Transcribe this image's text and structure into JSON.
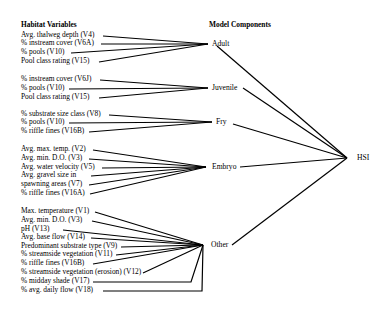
{
  "headers": {
    "left": "Habitat Variables",
    "middle": "Model Components"
  },
  "output": {
    "label": "HSI",
    "x": 347,
    "y": 158
  },
  "groups": [
    {
      "component": "Adult",
      "hub": [
        208,
        44
      ],
      "label_x": 212,
      "variables": [
        {
          "label": "Avg. thalweg depth (V4)",
          "y": 35,
          "end_x": 100
        },
        {
          "label": "% instream cover (V6A)",
          "y": 43,
          "end_x": 98
        },
        {
          "label": "% pools (V10)",
          "y": 52,
          "end_x": 68
        },
        {
          "label": "Pool class rating (V15)",
          "y": 61,
          "end_x": 96
        }
      ]
    },
    {
      "component": "Juvenile",
      "hub": [
        208,
        88
      ],
      "label_x": 212,
      "variables": [
        {
          "label": "% instream cover (V6J)",
          "y": 79,
          "end_x": 97
        },
        {
          "label": "% pools (V10)",
          "y": 88,
          "end_x": 66
        },
        {
          "label": "Pool class rating (V15)",
          "y": 97,
          "end_x": 96
        }
      ]
    },
    {
      "component": "Fry",
      "hub": [
        212,
        122
      ],
      "label_x": 216,
      "variables": [
        {
          "label": "% substrate size class (V8)",
          "y": 114,
          "end_x": 106
        },
        {
          "label": "% pools (V10)",
          "y": 122,
          "end_x": 66
        },
        {
          "label": "% riffle fines (V16B)",
          "y": 131,
          "end_x": 86
        }
      ]
    },
    {
      "component": "Embryo",
      "hub": [
        206,
        167
      ],
      "label_x": 212,
      "variables": [
        {
          "label": "Avg. max. temp. (V2)",
          "y": 149,
          "end_x": 90
        },
        {
          "label": "Avg. min. D.O. (V3)",
          "y": 158,
          "end_x": 86
        },
        {
          "label": "Avg. water velocity (V5)",
          "y": 167,
          "end_x": 99
        },
        {
          "label": "Avg. gravel size in",
          "y": 175,
          "end_x": 88
        },
        {
          "label": "spawning areas (V7)",
          "y": 184,
          "end_x": 86
        },
        {
          "label": "% riffle fines (V16A)",
          "y": 193,
          "end_x": 87
        }
      ]
    },
    {
      "component": "Other",
      "hub": [
        203,
        245
      ],
      "label_x": 211,
      "variables": [
        {
          "label": "Max. temperature (V1)",
          "y": 211,
          "end_x": 92
        },
        {
          "label": "Avg. min. D.O.  (V3)",
          "y": 220,
          "end_x": 89
        },
        {
          "label": "pH (V13)",
          "y": 229,
          "end_x": 60
        },
        {
          "label": "Avg. base flow (V14)",
          "y": 237,
          "end_x": 88
        },
        {
          "label": "Predominant substrate type (V9)",
          "y": 246,
          "end_x": 118
        },
        {
          "label": "% streamside vegetation (V11)",
          "y": 254,
          "end_x": 113
        },
        {
          "label": "% riffle fines (V16B)",
          "y": 263,
          "end_x": 90
        },
        {
          "label": "% streamside vegetation (erosion) (V12)",
          "y": 272,
          "end_x": 140
        },
        {
          "label": "% midday shade (V17)",
          "y": 281,
          "end_x": 90,
          "elbow_x": 191
        },
        {
          "label": "% avg. daily flow (V18)",
          "y": 290,
          "end_x": 100,
          "elbow_x": 202
        }
      ]
    }
  ],
  "component_to_hsi": [
    {
      "component": "Adult",
      "from": [
        217,
        46
      ]
    },
    {
      "component": "Juvenile",
      "from": [
        243,
        88
      ]
    },
    {
      "component": "Fry",
      "from": [
        233,
        124
      ]
    },
    {
      "component": "Embryo",
      "from": [
        240,
        167
      ]
    },
    {
      "component": "Other",
      "from": [
        232,
        245
      ]
    }
  ]
}
